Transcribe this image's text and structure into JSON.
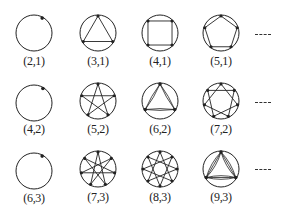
{
  "figure": {
    "stroke_color": "#222222",
    "continuation_marker": "----",
    "rows": [
      {
        "cells": [
          {
            "n": 2,
            "k": 1,
            "label": "(2,1)",
            "multiplicity": 2
          },
          {
            "n": 3,
            "k": 1,
            "label": "(3,1)",
            "multiplicity": 1
          },
          {
            "n": 4,
            "k": 1,
            "label": "(4,1)",
            "multiplicity": 1
          },
          {
            "n": 5,
            "k": 1,
            "label": "(5,1)",
            "multiplicity": 1
          }
        ]
      },
      {
        "cells": [
          {
            "n": 4,
            "k": 2,
            "label": "(4,2)",
            "multiplicity": 4
          },
          {
            "n": 5,
            "k": 2,
            "label": "(5,2)",
            "multiplicity": 1
          },
          {
            "n": 6,
            "k": 2,
            "label": "(6,2)",
            "multiplicity": 2
          },
          {
            "n": 7,
            "k": 2,
            "label": "(7,2)",
            "multiplicity": 1
          }
        ]
      },
      {
        "cells": [
          {
            "n": 6,
            "k": 3,
            "label": "(6,3)",
            "multiplicity": 6
          },
          {
            "n": 7,
            "k": 3,
            "label": "(7,3)",
            "multiplicity": 1
          },
          {
            "n": 8,
            "k": 3,
            "label": "(8,3)",
            "multiplicity": 1
          },
          {
            "n": 9,
            "k": 3,
            "label": "(9,3)",
            "multiplicity": 3
          }
        ]
      }
    ]
  }
}
